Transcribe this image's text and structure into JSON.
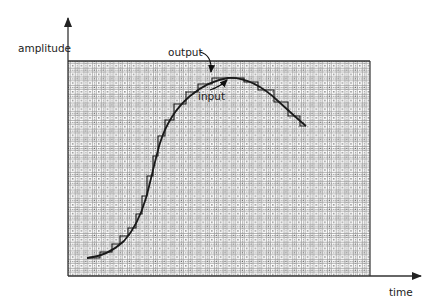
{
  "diagram": {
    "type": "signal-sampling-diagram",
    "y_axis_label": "amplitude",
    "x_axis_label": "time",
    "annotations": [
      {
        "label": "output",
        "target": "staircase sampled output near peak"
      },
      {
        "label": "input",
        "target": "smooth input curve near peak"
      }
    ],
    "colors": {
      "curve": "#1a1a1a",
      "axes": "#333333",
      "grid": "#8a8a8a",
      "frame": "#333333",
      "background": "#ffffff"
    }
  },
  "chart_data": {
    "type": "line",
    "title": "",
    "xlabel": "time",
    "ylabel": "amplitude",
    "grid": true,
    "series": [
      {
        "name": "input",
        "style": "smooth",
        "points_px": [
          [
            87,
            258
          ],
          [
            100,
            256
          ],
          [
            112,
            250
          ],
          [
            124,
            240
          ],
          [
            134,
            228
          ],
          [
            141,
            214
          ],
          [
            147,
            196
          ],
          [
            152,
            176
          ],
          [
            157,
            156
          ],
          [
            163,
            136
          ],
          [
            172,
            118
          ],
          [
            184,
            102
          ],
          [
            198,
            89
          ],
          [
            212,
            81
          ],
          [
            228,
            78
          ],
          [
            244,
            81
          ],
          [
            260,
            88
          ],
          [
            276,
            100
          ],
          [
            292,
            114
          ],
          [
            306,
            126
          ]
        ]
      },
      {
        "name": "output",
        "style": "staircase",
        "points_px": [
          [
            87,
            258
          ],
          [
            100,
            258
          ],
          [
            100,
            252
          ],
          [
            112,
            252
          ],
          [
            112,
            244
          ],
          [
            120,
            244
          ],
          [
            120,
            236
          ],
          [
            128,
            236
          ],
          [
            128,
            228
          ],
          [
            136,
            228
          ],
          [
            136,
            214
          ],
          [
            142,
            214
          ],
          [
            142,
            196
          ],
          [
            147,
            196
          ],
          [
            147,
            176
          ],
          [
            153,
            176
          ],
          [
            153,
            156
          ],
          [
            158,
            156
          ],
          [
            158,
            136
          ],
          [
            165,
            136
          ],
          [
            165,
            120
          ],
          [
            174,
            120
          ],
          [
            174,
            104
          ],
          [
            186,
            104
          ],
          [
            186,
            92
          ],
          [
            198,
            92
          ],
          [
            198,
            84
          ],
          [
            212,
            84
          ],
          [
            212,
            78
          ],
          [
            244,
            78
          ],
          [
            244,
            82
          ],
          [
            258,
            82
          ],
          [
            258,
            90
          ],
          [
            274,
            90
          ],
          [
            274,
            102
          ],
          [
            288,
            102
          ],
          [
            288,
            116
          ],
          [
            300,
            116
          ],
          [
            300,
            126
          ],
          [
            306,
            126
          ]
        ]
      }
    ]
  }
}
